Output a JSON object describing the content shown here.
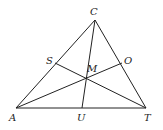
{
  "diagram": {
    "type": "triangle-with-cevians",
    "points": {
      "C": {
        "label": "C",
        "x": 95,
        "y": 20
      },
      "A": {
        "label": "A",
        "x": 16,
        "y": 108
      },
      "T": {
        "label": "T",
        "x": 146,
        "y": 108
      },
      "U": {
        "label": "U",
        "x": 82,
        "y": 108
      },
      "S": {
        "label": "S",
        "x": 55,
        "y": 63
      },
      "O": {
        "label": "O",
        "x": 122,
        "y": 63
      },
      "M": {
        "label": "M",
        "x": 86,
        "y": 79
      }
    },
    "segments": [
      [
        "A",
        "C"
      ],
      [
        "C",
        "T"
      ],
      [
        "A",
        "T"
      ],
      [
        "C",
        "U"
      ],
      [
        "A",
        "O"
      ],
      [
        "S",
        "T"
      ]
    ]
  }
}
